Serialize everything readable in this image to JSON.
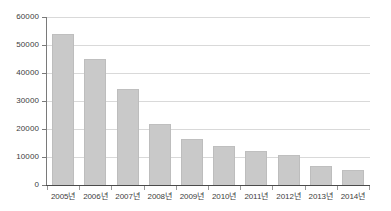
{
  "chart_data": {
    "type": "bar",
    "title": "",
    "xlabel": "",
    "ylabel": "",
    "categories": [
      "2005년",
      "2006년",
      "2007년",
      "2008년",
      "2009년",
      "2010년",
      "2011년",
      "2012년",
      "2013년",
      "2014년"
    ],
    "values": [
      54000,
      45000,
      34200,
      21700,
      16300,
      14000,
      12200,
      10600,
      6800,
      5300
    ],
    "series": [
      {
        "name": "",
        "values": [
          54000,
          45000,
          34200,
          21700,
          16300,
          14000,
          12200,
          10600,
          6800,
          5300
        ]
      }
    ],
    "ylim": [
      0,
      60000
    ],
    "ytick_labels": [
      "0",
      "10000",
      "20000",
      "30000",
      "40000",
      "50000",
      "60000"
    ],
    "ytick_values": [
      0,
      10000,
      20000,
      30000,
      40000,
      50000,
      60000
    ],
    "grid": true,
    "legend": null,
    "legend_position": "none",
    "bar_color": "#c9c9c9",
    "grid_color": "#d9d9d9",
    "axis_color": "#4a4a4a",
    "background_color": "#ffffff"
  }
}
